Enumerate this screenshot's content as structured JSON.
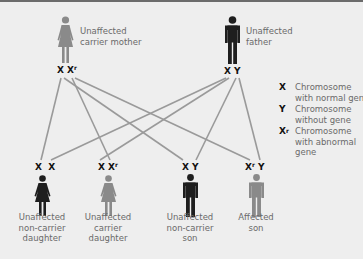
{
  "colors": {
    "background": "#eeeeee",
    "unaffected_figure": "#1e1e1e",
    "carrier_affected_figure": "#8a8a8a",
    "line": "#9a9a9a",
    "label_text": "#6a6a6a"
  },
  "parents": {
    "mother": {
      "label": "Unaffected carrier mother",
      "label_lines": [
        "Unaffected",
        "carrier mother"
      ],
      "chromosomes": [
        "X",
        "Xr"
      ],
      "figure": "female-icon",
      "status": "carrier"
    },
    "father": {
      "label": "Unaffected father",
      "label_lines": [
        "Unaffected",
        "father"
      ],
      "chromosomes": [
        "X",
        "Y"
      ],
      "figure": "male-icon",
      "status": "unaffected"
    }
  },
  "children": [
    {
      "label_lines": [
        "Unaffected",
        "non-carrier",
        "daughter"
      ],
      "chromosomes": [
        "X",
        "X"
      ],
      "figure": "female-icon",
      "status": "unaffected"
    },
    {
      "label_lines": [
        "Unaffected",
        "carrier",
        "daughter"
      ],
      "chromosomes": [
        "X",
        "Xr"
      ],
      "figure": "female-icon",
      "status": "carrier"
    },
    {
      "label_lines": [
        "Unaffected",
        "non-carrier",
        "son"
      ],
      "chromosomes": [
        "X",
        "Y"
      ],
      "figure": "male-icon",
      "status": "unaffected"
    },
    {
      "label_lines": [
        "Affected",
        "son"
      ],
      "chromosomes": [
        "Xr",
        "Y"
      ],
      "figure": "male-icon",
      "status": "affected"
    }
  ],
  "legend": [
    {
      "key": "X",
      "key_sup": "",
      "lines": [
        "Chromosome",
        "with normal gene"
      ]
    },
    {
      "key": "Y",
      "key_sup": "",
      "lines": [
        "Chromosome",
        "without gene"
      ]
    },
    {
      "key": "X",
      "key_sup": "r",
      "lines": [
        "Chromosome",
        "with abnormal",
        "gene"
      ]
    }
  ],
  "chrom_text": {
    "X": "X",
    "Y": "Y",
    "sup_r": "r"
  }
}
